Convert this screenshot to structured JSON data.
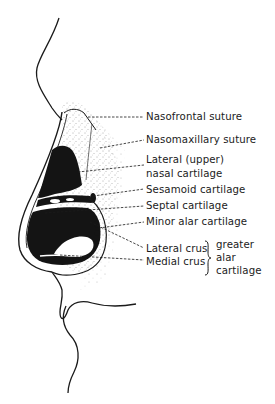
{
  "figure": {
    "labels": {
      "nasofrontal_suture": "Nasofrontal suture",
      "nasomaxillary_suture": "Nasomaxillary suture",
      "lateral_upper_line1": "Lateral (upper)",
      "lateral_upper_line2": "nasal cartilage",
      "sesamoid_cartilage": "Sesamoid cartilage",
      "septal_cartilage": "Septal cartilage",
      "minor_alar_cartilage": "Minor alar cartilage",
      "lateral_crus": "Lateral crus",
      "medial_crus": "Medial crus",
      "greater_alar_line1": "greater",
      "greater_alar_line2": "alar",
      "greater_alar_line3": "cartilage"
    },
    "group_brace": {
      "members": [
        "Lateral crus",
        "Medial crus"
      ],
      "group_label": "greater alar cartilage"
    },
    "colors": {
      "ink": "#1a1a1a",
      "stipple": "#555555",
      "background": "#ffffff"
    }
  }
}
